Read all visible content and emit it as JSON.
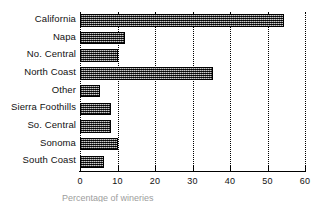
{
  "chart_data": {
    "type": "bar",
    "orientation": "horizontal",
    "title": "",
    "xlabel": "",
    "ylabel": "",
    "xlim": [
      0,
      60
    ],
    "xticks": [
      0,
      10,
      20,
      30,
      40,
      50,
      60
    ],
    "xtick_labels": [
      "0",
      "10",
      "20",
      "30",
      "40",
      "50",
      "60"
    ],
    "grid": "vertical-dotted",
    "legend": "none",
    "categories": [
      "California",
      "Napa",
      "No. Central",
      "North Coast",
      "Other",
      "Sierra Foothills",
      "So. Central",
      "Sonoma",
      "South Coast"
    ],
    "values": [
      54.5,
      12,
      10.2,
      35.5,
      5.3,
      8.3,
      8.3,
      10.1,
      6.4
    ],
    "bar_fill": "#5a5a5a",
    "bar_edge": "#000000",
    "axis_color": "#000000"
  },
  "caption": {
    "partial_text": "Percentage of wineries"
  }
}
